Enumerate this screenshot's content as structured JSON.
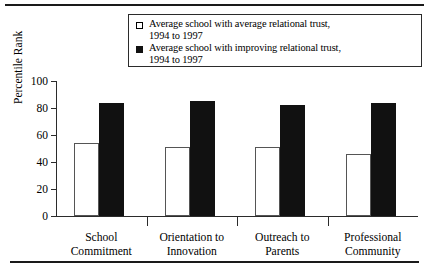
{
  "figure": {
    "background": "#ffffff",
    "rules": {
      "top": "horizontal-rule",
      "bottom": "horizontal-rule"
    }
  },
  "legend": {
    "position": "top-center",
    "entries": [
      {
        "marker": "open-square-swatch",
        "label": "Average school with average relational trust,\n1994 to 1997",
        "color": "#ffffff"
      },
      {
        "marker": "filled-square-swatch",
        "label": "Average school with improving relational trust,\n1994 to 1997",
        "color": "#111111"
      }
    ]
  },
  "chart_data": {
    "type": "bar",
    "title": "",
    "xlabel": "",
    "ylabel": "Percentile Rank",
    "ylim": [
      0,
      100
    ],
    "yticks": [
      0,
      20,
      40,
      60,
      80,
      100
    ],
    "ytick_labels": [
      "0",
      "20",
      "40",
      "60",
      "80",
      "100"
    ],
    "grid": false,
    "legend_position": "top-center",
    "categories": [
      "School\nCommitment",
      "Orientation to\nInnovation",
      "Outreach to\nParents",
      "Professional\nCommunity"
    ],
    "series": [
      {
        "name": "Average school with average relational trust, 1994 to 1997",
        "color": "#ffffff",
        "edgecolor": "#555555",
        "values": [
          54,
          51,
          51,
          46
        ]
      },
      {
        "name": "Average school with improving relational trust, 1994 to 1997",
        "color": "#111111",
        "edgecolor": "#111111",
        "values": [
          84,
          85,
          82,
          84
        ]
      }
    ]
  }
}
